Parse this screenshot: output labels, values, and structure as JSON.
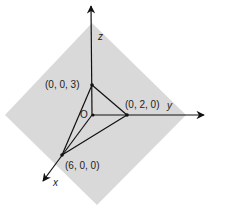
{
  "diagram": {
    "plane_color": "#d9d9d9",
    "line_color": "#111111",
    "axes": {
      "x": {
        "label": "x"
      },
      "y": {
        "label": "y"
      },
      "z": {
        "label": "z"
      }
    },
    "origin_label": "O",
    "points": [
      {
        "label": "(0, 0, 3)"
      },
      {
        "label": "(0, 2, 0)"
      },
      {
        "label": "(6, 0, 0)"
      }
    ]
  }
}
